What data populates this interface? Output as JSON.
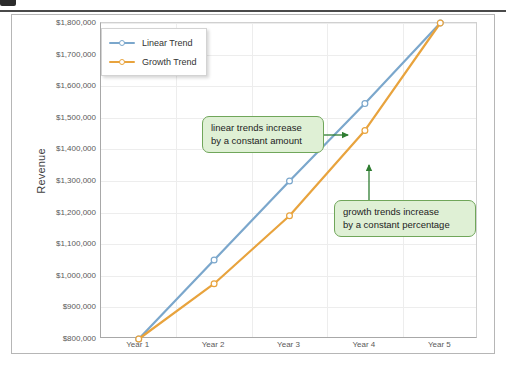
{
  "top_strip": {
    "glyph_text": "· · ·· ·· ·"
  },
  "chart_data": {
    "type": "line",
    "title": "",
    "xlabel": "",
    "ylabel": "Revenue",
    "categories": [
      "Year 1",
      "Year 2",
      "Year 3",
      "Year 4",
      "Year 5"
    ],
    "series": [
      {
        "name": "Linear Trend",
        "color": "#7BA7CC",
        "values": [
          800000,
          1050000,
          1300000,
          1545000,
          1800000
        ]
      },
      {
        "name": "Growth Trend",
        "color": "#E8A33D",
        "values": [
          800000,
          975000,
          1190000,
          1460000,
          1800000
        ]
      }
    ],
    "ylim": [
      800000,
      1800000
    ],
    "yticks": [
      800000,
      900000,
      1000000,
      1100000,
      1200000,
      1300000,
      1400000,
      1500000,
      1600000,
      1700000,
      1800000
    ],
    "ytick_labels": [
      "$800,000",
      "$900,000",
      "$1,000,000",
      "$1,100,000",
      "$1,200,000",
      "$1,300,000",
      "$1,400,000",
      "$1,500,000",
      "$1,600,000",
      "$1,700,000",
      "$1,800,000"
    ],
    "grid": true,
    "legend_position": "top-left",
    "marker": "open-circle",
    "annotations": [
      {
        "text": "linear trends increase\nby a constant amount",
        "target_series": "Linear Trend",
        "target_category": "Year 4"
      },
      {
        "text": "growth trends increase\nby a constant percentage",
        "target_series": "Growth Trend",
        "target_category": "Year 4"
      }
    ]
  },
  "legend": {
    "items": [
      {
        "label": "Linear Trend"
      },
      {
        "label": "Growth Trend"
      }
    ]
  },
  "callouts": {
    "linear": "linear trends increase\nby a constant amount",
    "growth": "growth trends increase\nby a constant percentage"
  }
}
